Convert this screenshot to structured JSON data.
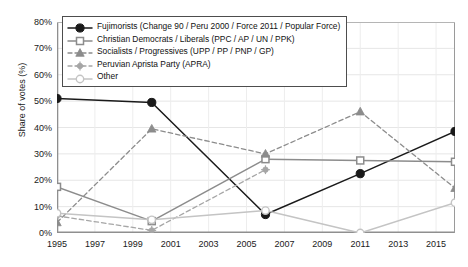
{
  "chart_data": {
    "type": "line",
    "title": "",
    "xlabel": "",
    "ylabel": "Share of votes (%)",
    "xlim": [
      1995,
      2016
    ],
    "ylim": [
      0,
      80
    ],
    "grid": true,
    "legend_position": "top-left",
    "x_ticks": [
      "1995",
      "1997",
      "1999",
      "2001",
      "2003",
      "2005",
      "2007",
      "2009",
      "2011",
      "2013",
      "2015"
    ],
    "x_tick_values": [
      1995,
      1997,
      1999,
      2001,
      2003,
      2005,
      2007,
      2009,
      2011,
      2013,
      2015
    ],
    "y_ticks": [
      "0%",
      "10%",
      "20%",
      "30%",
      "40%",
      "50%",
      "60%",
      "70%",
      "80%"
    ],
    "y_tick_values": [
      0,
      10,
      20,
      30,
      40,
      50,
      60,
      70,
      80
    ],
    "series": [
      {
        "name": "Fujimorists (Change 90 / Peru 2000 / Force 2011 / Popular Force)",
        "color": "#1a1a1a",
        "dash": "none",
        "marker": "filled-circle",
        "x": [
          1995,
          2000,
          2006,
          2011,
          2016
        ],
        "values": [
          51,
          49.5,
          7,
          22.5,
          38.5
        ]
      },
      {
        "name": "Christian Democrats / Liberals (PPC / AP / UN / PPK)",
        "color": "#8c8c8c",
        "dash": "none",
        "marker": "open-square",
        "x": [
          1995,
          2000,
          2006,
          2011,
          2016
        ],
        "values": [
          17.5,
          4.5,
          28,
          27.5,
          27
        ]
      },
      {
        "name": "Socialists / Progressives (UPP / PP / PNP / GP)",
        "color": "#8c8c8c",
        "dash": "dashed",
        "marker": "filled-triangle",
        "x": [
          1995,
          2000,
          2006,
          2011,
          2016
        ],
        "values": [
          4,
          39.5,
          30,
          46,
          17
        ]
      },
      {
        "name": "Peruvian Aprista Party (APRA)",
        "color": "#a6a6a6",
        "dash": "dashed",
        "marker": "plus",
        "x": [
          1995,
          2000,
          2006
        ],
        "values": [
          6.5,
          1,
          24
        ]
      },
      {
        "name": "Other",
        "color": "#c4c4c4",
        "dash": "none",
        "marker": "open-circle",
        "x": [
          1995,
          2000,
          2006,
          2011,
          2016
        ],
        "values": [
          7.5,
          5,
          8.5,
          0,
          11.5
        ]
      }
    ]
  }
}
